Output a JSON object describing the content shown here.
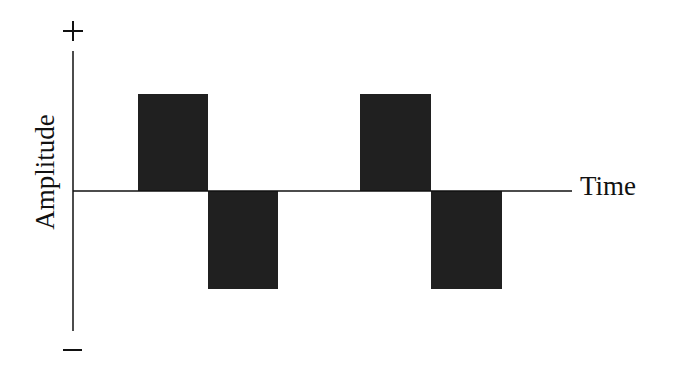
{
  "diagram": {
    "type": "square-wave",
    "y_axis": {
      "label": "Amplitude",
      "positive_symbol": "+",
      "negative_symbol": "−"
    },
    "x_axis": {
      "label": "Time"
    },
    "colors": {
      "pulse_fill": "#202020",
      "axis": "#111111",
      "background": "#ffffff"
    },
    "pulses": [
      {
        "polarity": "positive",
        "x": 138,
        "y": 94,
        "width": 70,
        "height": 97
      },
      {
        "polarity": "negative",
        "x": 208,
        "y": 191,
        "width": 70,
        "height": 98
      },
      {
        "polarity": "positive",
        "x": 360,
        "y": 94,
        "width": 71,
        "height": 97
      },
      {
        "polarity": "negative",
        "x": 431,
        "y": 191,
        "width": 71,
        "height": 98
      }
    ]
  }
}
